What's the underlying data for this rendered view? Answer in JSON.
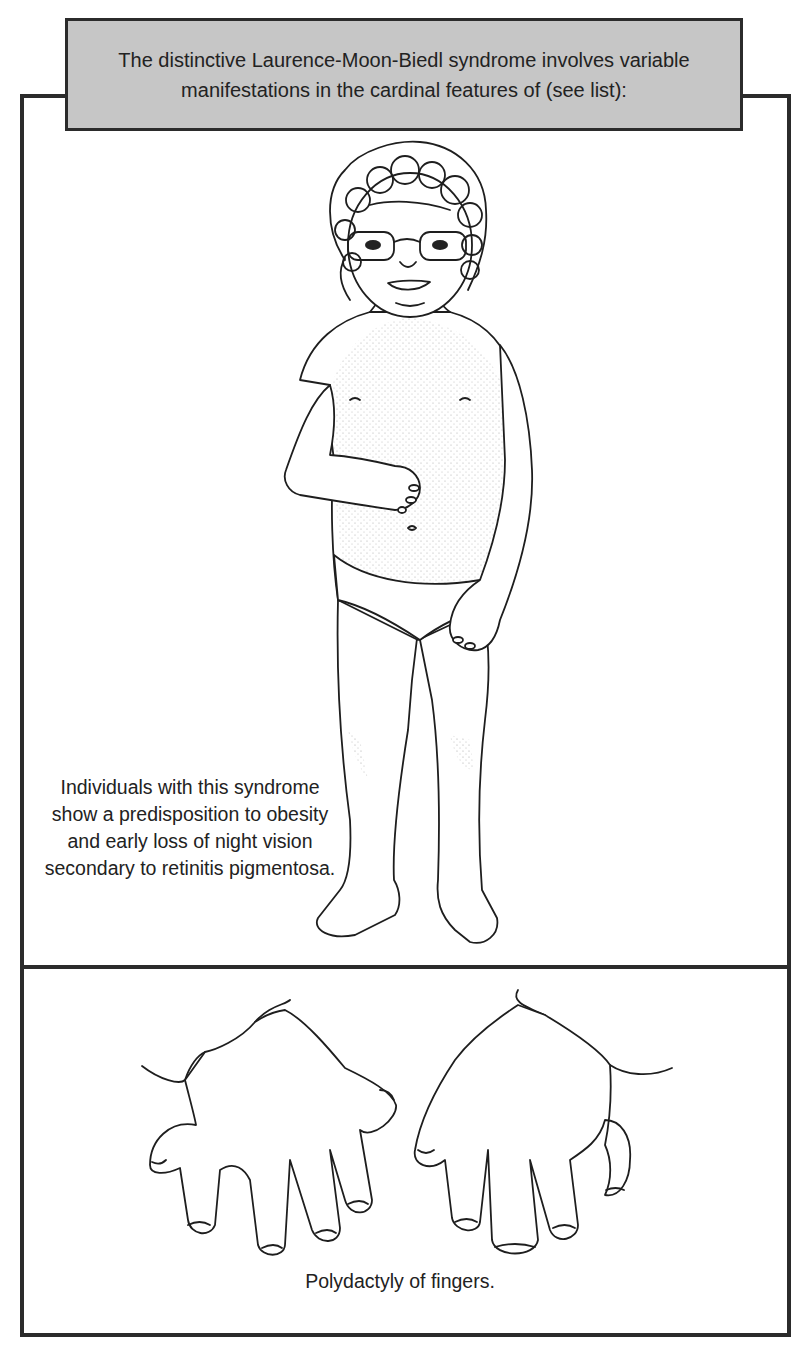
{
  "header": {
    "line1": "The distinctive Laurence-Moon-Biedl syndrome involves variable",
    "line2": "manifestations in the cardinal features of (see list):"
  },
  "panels": [
    {
      "id": "child-figure",
      "illustration": "child-with-glasses-full-body",
      "caption_lines": [
        "Individuals with this syndrome",
        "show a predisposition to obesity",
        "and early loss of night vision",
        "secondary to retinitis pigmentosa."
      ]
    },
    {
      "id": "hands",
      "illustration": "hands-with-polydactyly",
      "caption_lines": [
        "Polydactyly of fingers."
      ]
    }
  ],
  "colors": {
    "header_bg": "#c6c6c6",
    "border": "#2b2b2b",
    "text": "#222222"
  }
}
